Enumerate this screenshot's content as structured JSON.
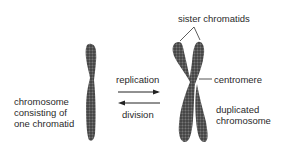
{
  "diagram": {
    "labels": {
      "single_chromosome": [
        "chromosome",
        "consisting of",
        "one chromatid"
      ],
      "replication": "replication",
      "division": "division",
      "sister_chromatids": "sister chromatids",
      "centromere": "centromere",
      "duplicated_chromosome": [
        "duplicated",
        "chromosome"
      ]
    },
    "arrows": [
      {
        "label": "replication",
        "direction": "right"
      },
      {
        "label": "division",
        "direction": "left"
      }
    ],
    "colors": {
      "chromosome": "#555555",
      "text": "#2a2a2a",
      "lines": "#333333"
    }
  }
}
